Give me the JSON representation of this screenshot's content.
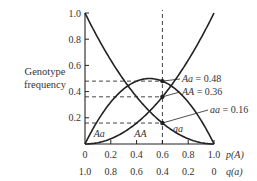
{
  "chart_data": {
    "type": "line",
    "title": "",
    "xlabel": "p(A)",
    "xlabel2": "q(a)",
    "ylabel_lines": [
      "Genotype",
      "frequency"
    ],
    "xlim": [
      0,
      1
    ],
    "ylim": [
      0,
      1
    ],
    "x_ticks": [
      "0",
      "0.2",
      "0.4",
      "0.6",
      "0.8",
      "1.0"
    ],
    "x_ticks_values": [
      0,
      0.2,
      0.4,
      0.6,
      0.8,
      1.0
    ],
    "x2_ticks": [
      "1.0",
      "0.8",
      "0.6",
      "0.4",
      "0.2",
      "0"
    ],
    "y_ticks": [
      "0.2",
      "0.4",
      "0.6",
      "0.8",
      "1.0"
    ],
    "y_ticks_values": [
      0.2,
      0.4,
      0.6,
      0.8,
      1.0
    ],
    "grid": false,
    "series": [
      {
        "name": "AA",
        "formula": "p^2",
        "curve_label": "AA",
        "label_at": 0.43
      },
      {
        "name": "Aa",
        "formula": "2p(1-p)",
        "curve_label": "Aa",
        "label_at": 0.11
      },
      {
        "name": "aa",
        "formula": "(1-p)^2",
        "curve_label": "aa",
        "label_at": 0.72
      }
    ],
    "highlight_p": 0.6,
    "annotations": [
      {
        "genotype": "Aa",
        "text": "= 0.48",
        "value": 0.48
      },
      {
        "genotype": "AA",
        "text": "= 0.36",
        "value": 0.36
      },
      {
        "genotype": "aa",
        "text": "= 0.16",
        "value": 0.16
      }
    ]
  }
}
